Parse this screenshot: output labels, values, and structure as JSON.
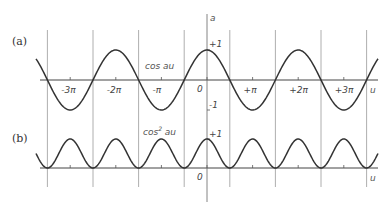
{
  "chart_data": [
    {
      "type": "line",
      "panel_label": "(a)",
      "title": "",
      "series": [
        {
          "name": "cos au",
          "function": "cos(a*u)",
          "x_range_pi": [
            -3.75,
            3.75
          ]
        }
      ],
      "xlabel": "u",
      "ylabel": "a",
      "x_tick_labels": [
        "-3π",
        "-2π",
        "-π",
        "0",
        "+π",
        "+2π",
        "+3π"
      ],
      "x_ticks_pi": [
        -3,
        -2,
        -1,
        0,
        1,
        2,
        3
      ],
      "y_tick_labels": [
        "+1",
        "-1"
      ],
      "y_ticks": [
        1,
        -1
      ],
      "ylim": [
        -1,
        1
      ],
      "grid": "vertical lines at zero crossings (odd multiples of π/2)",
      "annotation": "cos au"
    },
    {
      "type": "line",
      "panel_label": "(b)",
      "series": [
        {
          "name": "cos² au",
          "function": "cos(a*u)^2",
          "x_range_pi": [
            -3.75,
            3.75
          ]
        }
      ],
      "xlabel": "u",
      "x_tick_labels": [
        "0"
      ],
      "y_tick_labels": [
        "+1"
      ],
      "y_ticks": [
        1
      ],
      "ylim": [
        0,
        1
      ],
      "grid": "vertical lines at zero crossings (odd multiples of π/2)",
      "annotation": "cos² au"
    }
  ],
  "labels": {
    "panel_a": "(a)",
    "panel_b": "(b)",
    "axis_a": "a",
    "axis_u_top": "u",
    "axis_u_bottom": "u",
    "cos_label": "cos au",
    "cos2_label_base": "cos",
    "cos2_label_sup": "2",
    "cos2_label_tail": " au",
    "plus_one_top": "+1",
    "minus_one_top": "-1",
    "plus_one_bottom": "+1",
    "zero_top": "0",
    "zero_bottom": "0",
    "ticks": [
      "-3π",
      "-2π",
      "-π",
      "+π",
      "+2π",
      "+3π"
    ]
  }
}
